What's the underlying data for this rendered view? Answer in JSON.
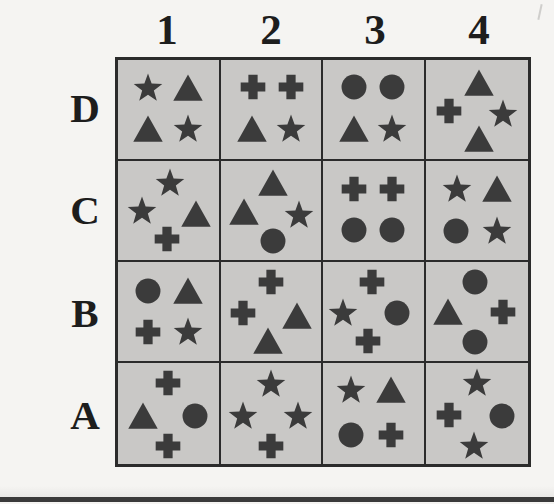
{
  "figure": {
    "type": "symbol-grid",
    "rows": 4,
    "cols": 4,
    "colors": {
      "page_background": "#f5f4f2",
      "cell_fill": "#c9c8c6",
      "grid_line": "#2b2b2b",
      "symbol": "#3b3b3b",
      "label_text": "#1d1d1d"
    }
  },
  "column_labels": [
    "1",
    "2",
    "3",
    "4"
  ],
  "row_labels": [
    "D",
    "C",
    "B",
    "A"
  ],
  "cells": [
    {
      "id": "D1",
      "row": "D",
      "col": "1",
      "layout": "quad",
      "shapes": [
        {
          "shape": "star",
          "x": 30,
          "y": 28
        },
        {
          "shape": "triangle",
          "x": 70,
          "y": 28
        },
        {
          "shape": "triangle",
          "x": 30,
          "y": 70
        },
        {
          "shape": "star",
          "x": 70,
          "y": 70
        }
      ]
    },
    {
      "id": "D2",
      "row": "D",
      "col": "2",
      "layout": "quad",
      "shapes": [
        {
          "shape": "cross",
          "x": 32,
          "y": 27
        },
        {
          "shape": "cross",
          "x": 70,
          "y": 27
        },
        {
          "shape": "triangle",
          "x": 31,
          "y": 70
        },
        {
          "shape": "star",
          "x": 70,
          "y": 70
        }
      ]
    },
    {
      "id": "D3",
      "row": "D",
      "col": "3",
      "layout": "quad",
      "shapes": [
        {
          "shape": "circle",
          "x": 31,
          "y": 27
        },
        {
          "shape": "circle",
          "x": 69,
          "y": 27
        },
        {
          "shape": "triangle",
          "x": 31,
          "y": 70
        },
        {
          "shape": "star",
          "x": 69,
          "y": 70
        }
      ]
    },
    {
      "id": "D4",
      "row": "D",
      "col": "4",
      "layout": "diamond",
      "shapes": [
        {
          "shape": "triangle",
          "x": 52,
          "y": 23
        },
        {
          "shape": "cross",
          "x": 23,
          "y": 52
        },
        {
          "shape": "star",
          "x": 76,
          "y": 55
        },
        {
          "shape": "triangle",
          "x": 52,
          "y": 80
        }
      ]
    },
    {
      "id": "C1",
      "row": "C",
      "col": "1",
      "layout": "diamond",
      "shapes": [
        {
          "shape": "star",
          "x": 52,
          "y": 22
        },
        {
          "shape": "star",
          "x": 24,
          "y": 50
        },
        {
          "shape": "triangle",
          "x": 78,
          "y": 54
        },
        {
          "shape": "cross",
          "x": 49,
          "y": 79
        }
      ]
    },
    {
      "id": "C2",
      "row": "C",
      "col": "2",
      "layout": "diamond",
      "shapes": [
        {
          "shape": "triangle",
          "x": 52,
          "y": 22
        },
        {
          "shape": "triangle",
          "x": 23,
          "y": 52
        },
        {
          "shape": "star",
          "x": 78,
          "y": 55
        },
        {
          "shape": "circle",
          "x": 52,
          "y": 81
        }
      ]
    },
    {
      "id": "C3",
      "row": "C",
      "col": "3",
      "layout": "quad",
      "shapes": [
        {
          "shape": "cross",
          "x": 31,
          "y": 28
        },
        {
          "shape": "cross",
          "x": 69,
          "y": 28
        },
        {
          "shape": "circle",
          "x": 31,
          "y": 70
        },
        {
          "shape": "circle",
          "x": 69,
          "y": 70
        }
      ]
    },
    {
      "id": "C4",
      "row": "C",
      "col": "4",
      "layout": "quad",
      "shapes": [
        {
          "shape": "star",
          "x": 31,
          "y": 28
        },
        {
          "shape": "triangle",
          "x": 70,
          "y": 28
        },
        {
          "shape": "circle",
          "x": 30,
          "y": 71
        },
        {
          "shape": "star",
          "x": 70,
          "y": 71
        }
      ]
    },
    {
      "id": "B1",
      "row": "B",
      "col": "1",
      "layout": "quad",
      "shapes": [
        {
          "shape": "circle",
          "x": 30,
          "y": 29
        },
        {
          "shape": "triangle",
          "x": 70,
          "y": 29
        },
        {
          "shape": "cross",
          "x": 30,
          "y": 71
        },
        {
          "shape": "star",
          "x": 70,
          "y": 71
        }
      ]
    },
    {
      "id": "B2",
      "row": "B",
      "col": "2",
      "layout": "diamond",
      "shapes": [
        {
          "shape": "cross",
          "x": 50,
          "y": 20
        },
        {
          "shape": "cross",
          "x": 22,
          "y": 52
        },
        {
          "shape": "triangle",
          "x": 76,
          "y": 55
        },
        {
          "shape": "triangle",
          "x": 47,
          "y": 80
        }
      ]
    },
    {
      "id": "B3",
      "row": "B",
      "col": "3",
      "layout": "diamond",
      "shapes": [
        {
          "shape": "cross",
          "x": 49,
          "y": 20
        },
        {
          "shape": "star",
          "x": 20,
          "y": 52
        },
        {
          "shape": "circle",
          "x": 74,
          "y": 52
        },
        {
          "shape": "cross",
          "x": 45,
          "y": 80
        }
      ]
    },
    {
      "id": "B4",
      "row": "B",
      "col": "4",
      "layout": "diamond",
      "shapes": [
        {
          "shape": "circle",
          "x": 48,
          "y": 20
        },
        {
          "shape": "triangle",
          "x": 22,
          "y": 51
        },
        {
          "shape": "cross",
          "x": 76,
          "y": 51
        },
        {
          "shape": "circle",
          "x": 48,
          "y": 81
        }
      ]
    },
    {
      "id": "A1",
      "row": "A",
      "col": "1",
      "layout": "diamond",
      "shapes": [
        {
          "shape": "cross",
          "x": 50,
          "y": 20
        },
        {
          "shape": "triangle",
          "x": 25,
          "y": 52
        },
        {
          "shape": "circle",
          "x": 77,
          "y": 52
        },
        {
          "shape": "cross",
          "x": 50,
          "y": 82
        }
      ]
    },
    {
      "id": "A2",
      "row": "A",
      "col": "2",
      "layout": "diamond",
      "shapes": [
        {
          "shape": "star",
          "x": 50,
          "y": 21
        },
        {
          "shape": "star",
          "x": 22,
          "y": 52
        },
        {
          "shape": "star",
          "x": 77,
          "y": 52
        },
        {
          "shape": "cross",
          "x": 50,
          "y": 82
        }
      ]
    },
    {
      "id": "A3",
      "row": "A",
      "col": "3",
      "layout": "quad",
      "shapes": [
        {
          "shape": "star",
          "x": 28,
          "y": 27
        },
        {
          "shape": "triangle",
          "x": 68,
          "y": 27
        },
        {
          "shape": "circle",
          "x": 28,
          "y": 71
        },
        {
          "shape": "cross",
          "x": 68,
          "y": 71
        }
      ]
    },
    {
      "id": "A4",
      "row": "A",
      "col": "4",
      "layout": "diamond",
      "shapes": [
        {
          "shape": "star",
          "x": 50,
          "y": 20
        },
        {
          "shape": "cross",
          "x": 23,
          "y": 51
        },
        {
          "shape": "circle",
          "x": 75,
          "y": 52
        },
        {
          "shape": "star",
          "x": 47,
          "y": 82
        }
      ]
    }
  ]
}
